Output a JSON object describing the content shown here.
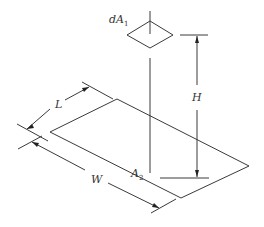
{
  "figure": {
    "colors": {
      "line": "#3a3a3a",
      "text": "#333333",
      "background": "#ffffff"
    }
  },
  "labels": {
    "dA1": {
      "main": "dA",
      "sub": "1"
    },
    "A2": {
      "main": "A",
      "sub": "2"
    },
    "H": "H",
    "L": "L",
    "W": "W"
  }
}
